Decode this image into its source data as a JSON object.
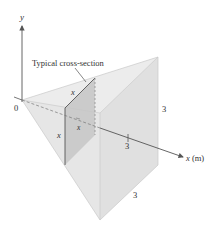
{
  "figure": {
    "caption_label": "Typical cross-section",
    "axes": {
      "y_label": "y",
      "x_label": "x (m)",
      "origin_label": "0",
      "x_tick_label": "3"
    },
    "dimensions": {
      "height_label": "3",
      "base_label": "3",
      "section_top_label": "x",
      "section_side_label": "x",
      "section_position_label": "x"
    },
    "colors": {
      "background": "#ffffff",
      "line": "#555555",
      "face_light": "#ececec",
      "face_mid": "#e2e2e2",
      "face_dark": "#d6d6d6",
      "section_fill": "#c4c4c4",
      "text": "#333333"
    }
  }
}
